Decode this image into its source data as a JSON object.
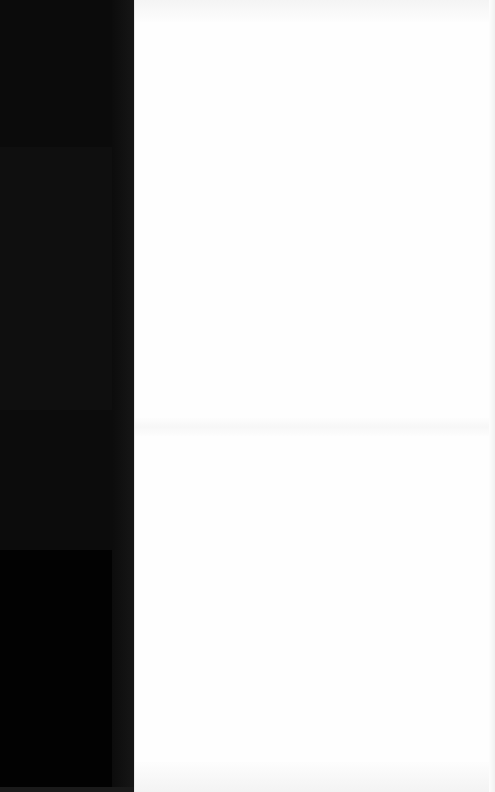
{
  "screen": {
    "description": "Mostly blank screen: dark left panel with faint horizontal bands and a near-white content area; no legible text is rendered"
  },
  "sidebar": {
    "background": "#0a0a0a",
    "bands": [
      {
        "name": "band-1",
        "color": "#0b0b0b"
      },
      {
        "name": "band-2",
        "color": "#0f0f0f"
      },
      {
        "name": "band-3",
        "color": "#0c0c0c"
      },
      {
        "name": "band-4",
        "color": "#020202"
      }
    ],
    "bottom_strip_color": "#1a1a1a"
  },
  "content": {
    "background": "#fefefe",
    "text_items": []
  }
}
